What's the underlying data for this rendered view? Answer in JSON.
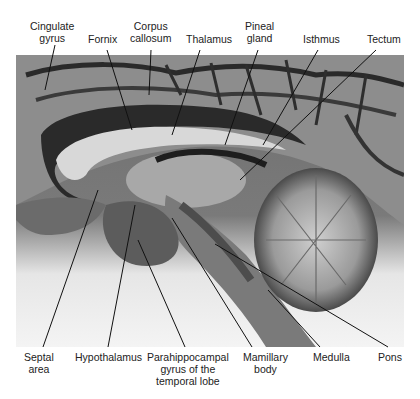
{
  "figure": {
    "top_labels": [
      {
        "id": "cingulate-gyrus",
        "lines": [
          "Cingulate",
          "gyrus"
        ]
      },
      {
        "id": "fornix",
        "lines": [
          "Fornix"
        ]
      },
      {
        "id": "corpus-callosum",
        "lines": [
          "Corpus",
          "callosum"
        ]
      },
      {
        "id": "thalamus",
        "lines": [
          "Thalamus"
        ]
      },
      {
        "id": "pineal-gland",
        "lines": [
          "Pineal",
          "gland"
        ]
      },
      {
        "id": "isthmus",
        "lines": [
          "Isthmus"
        ]
      },
      {
        "id": "tectum",
        "lines": [
          "Tectum"
        ]
      }
    ],
    "bottom_labels": [
      {
        "id": "septal-area",
        "lines": [
          "Septal",
          "area"
        ]
      },
      {
        "id": "hypothalamus",
        "lines": [
          "Hypothalamus"
        ]
      },
      {
        "id": "parahippocampal-gyrus",
        "lines": [
          "Parahippocampal",
          "gyrus of the",
          "temporal lobe"
        ]
      },
      {
        "id": "mamillary-body",
        "lines": [
          "Mamillary",
          "body"
        ]
      },
      {
        "id": "medulla",
        "lines": [
          "Medulla"
        ]
      },
      {
        "id": "pons",
        "lines": [
          "Pons"
        ]
      }
    ]
  }
}
